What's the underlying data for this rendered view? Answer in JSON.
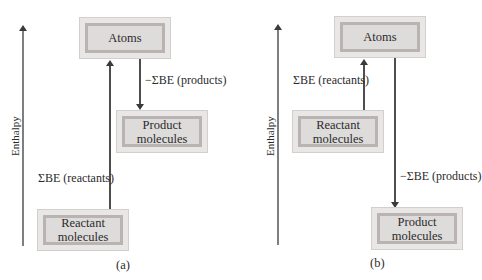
{
  "panels": [
    {
      "id": "a",
      "caption": "(a)",
      "axis_label": "Enthalpy",
      "boxes": {
        "atoms": "Atoms",
        "product": [
          "Product",
          "molecules"
        ],
        "reactant": [
          "Reactant",
          "molecules"
        ]
      },
      "arrows": {
        "up_label": "ΣBE (reactants)",
        "down_label": "−ΣBE (products)"
      }
    },
    {
      "id": "b",
      "caption": "(b)",
      "axis_label": "Enthalpy",
      "boxes": {
        "atoms": "Atoms",
        "reactant": [
          "Reactant",
          "molecules"
        ],
        "product": [
          "Product",
          "molecules"
        ]
      },
      "arrows": {
        "up_label": "ΣBE (reactants)",
        "down_label": "−ΣBE (products)"
      }
    }
  ],
  "colors": {
    "arrow": "#3a3a3a",
    "box_outer": "#e9e6e6",
    "box_border": "#b9b3b3",
    "box_fill": "#dedbdb"
  }
}
